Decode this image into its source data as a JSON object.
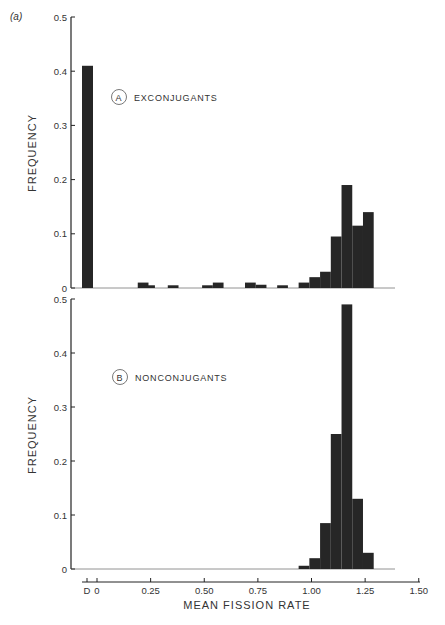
{
  "figure_label": "(a)",
  "chart_data": [
    {
      "type": "bar",
      "panel": "A",
      "title": "EXCONJUGANTS",
      "ylabel": "FREQUENCY",
      "xlabel": "",
      "ylim": [
        0,
        0.5
      ],
      "yticks": [
        "0",
        "0.1",
        "0.2",
        "0.3",
        "0.4",
        "0.5"
      ],
      "bin_width": 0.05,
      "bins": [
        {
          "x": "D",
          "value": 0.41
        },
        {
          "x": 0.19,
          "value": 0.01
        },
        {
          "x": 0.22,
          "value": 0.005
        },
        {
          "x": 0.33,
          "value": 0.005
        },
        {
          "x": 0.49,
          "value": 0.005
        },
        {
          "x": 0.54,
          "value": 0.01
        },
        {
          "x": 0.69,
          "value": 0.01
        },
        {
          "x": 0.74,
          "value": 0.006
        },
        {
          "x": 0.84,
          "value": 0.005
        },
        {
          "x": 0.94,
          "value": 0.01
        },
        {
          "x": 0.99,
          "value": 0.02
        },
        {
          "x": 1.04,
          "value": 0.03
        },
        {
          "x": 1.09,
          "value": 0.095
        },
        {
          "x": 1.14,
          "value": 0.19
        },
        {
          "x": 1.19,
          "value": 0.115
        },
        {
          "x": 1.24,
          "value": 0.14
        }
      ],
      "grid": false
    },
    {
      "type": "bar",
      "panel": "B",
      "title": "NONCONJUGANTS",
      "ylabel": "FREQUENCY",
      "xlabel": "MEAN FISSION RATE",
      "ylim": [
        0,
        0.5
      ],
      "yticks": [
        "0",
        "0.1",
        "0.2",
        "0.3",
        "0.4",
        "0.5"
      ],
      "xticks": [
        "D",
        "0",
        "0.25",
        "0.50",
        "0.75",
        "1.00",
        "1.25",
        "1.50"
      ],
      "xlim": [
        0,
        1.5
      ],
      "bin_width": 0.05,
      "bins": [
        {
          "x": 0.94,
          "value": 0.006
        },
        {
          "x": 0.99,
          "value": 0.02
        },
        {
          "x": 1.04,
          "value": 0.085
        },
        {
          "x": 1.09,
          "value": 0.25
        },
        {
          "x": 1.14,
          "value": 0.49
        },
        {
          "x": 1.19,
          "value": 0.13
        },
        {
          "x": 1.24,
          "value": 0.03
        }
      ],
      "grid": false
    }
  ]
}
